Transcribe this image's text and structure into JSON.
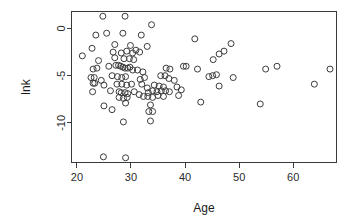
{
  "figure": {
    "background_color": "#ffffff",
    "point_color": "#3c3c3c",
    "axis_color": "#3a3a3a",
    "width": 354,
    "height": 222
  },
  "chart_data": {
    "type": "scatter",
    "title": "",
    "subtitle": "",
    "xlabel": "Age",
    "ylabel": "lnk",
    "xlim": [
      19.0,
      68.0
    ],
    "ylim": [
      -14.2,
      1.8
    ],
    "xticks": [
      20,
      30,
      40,
      50,
      60
    ],
    "xtick_labels": [
      "20",
      "30",
      "40",
      "50",
      "60"
    ],
    "yticks": [
      0,
      -5,
      -10
    ],
    "ytick_labels": [
      "0",
      "-5",
      "-10"
    ],
    "grid": false,
    "legend": null,
    "marker": "open-circle",
    "marker_size": 3,
    "n_points": 116,
    "annotations": [],
    "points": [
      [
        24.8,
        1.3
      ],
      [
        28.9,
        1.3
      ],
      [
        33.8,
        0.4
      ],
      [
        23.5,
        -0.7
      ],
      [
        25.5,
        -0.5
      ],
      [
        28.5,
        -0.5
      ],
      [
        31.9,
        -0.7
      ],
      [
        41.8,
        -1.1
      ],
      [
        48.5,
        -1.6
      ],
      [
        22.8,
        -2.1
      ],
      [
        27.0,
        -1.7
      ],
      [
        29.9,
        -1.8
      ],
      [
        33.0,
        -1.9
      ],
      [
        21.0,
        -2.9
      ],
      [
        26.7,
        -2.5
      ],
      [
        28.2,
        -2.6
      ],
      [
        29.2,
        -2.4
      ],
      [
        30.3,
        -2.6
      ],
      [
        30.9,
        -2.3
      ],
      [
        31.6,
        -2.5
      ],
      [
        46.3,
        -2.7
      ],
      [
        47.2,
        -2.4
      ],
      [
        24.0,
        -3.4
      ],
      [
        27.0,
        -3.1
      ],
      [
        28.7,
        -3.2
      ],
      [
        29.7,
        -3.2
      ],
      [
        30.5,
        -3.3
      ],
      [
        45.2,
        -3.3
      ],
      [
        23.0,
        -4.3
      ],
      [
        23.7,
        -4.2
      ],
      [
        25.9,
        -4.0
      ],
      [
        27.2,
        -3.9
      ],
      [
        27.7,
        -3.9
      ],
      [
        28.1,
        -4.0
      ],
      [
        28.5,
        -4.1
      ],
      [
        28.9,
        -4.2
      ],
      [
        29.4,
        -4.2
      ],
      [
        29.8,
        -4.1
      ],
      [
        30.3,
        -4.4
      ],
      [
        31.2,
        -4.4
      ],
      [
        32.2,
        -4.6
      ],
      [
        36.5,
        -4.2
      ],
      [
        37.2,
        -4.3
      ],
      [
        39.7,
        -4.0
      ],
      [
        40.2,
        -4.0
      ],
      [
        42.3,
        -4.3
      ],
      [
        54.9,
        -4.3
      ],
      [
        57.0,
        -4.0
      ],
      [
        66.8,
        -4.3
      ],
      [
        22.6,
        -5.2
      ],
      [
        23.2,
        -5.2
      ],
      [
        24.5,
        -5.5
      ],
      [
        26.5,
        -5.0
      ],
      [
        27.5,
        -5.1
      ],
      [
        28.3,
        -5.2
      ],
      [
        29.0,
        -5.1
      ],
      [
        31.7,
        -5.4
      ],
      [
        32.5,
        -5.2
      ],
      [
        35.5,
        -5.0
      ],
      [
        36.3,
        -5.0
      ],
      [
        37.0,
        -5.3
      ],
      [
        38.0,
        -5.5
      ],
      [
        44.4,
        -5.1
      ],
      [
        45.1,
        -5.0
      ],
      [
        45.8,
        -4.9
      ],
      [
        48.9,
        -5.2
      ],
      [
        23.0,
        -5.8
      ],
      [
        23.3,
        -5.8
      ],
      [
        25.0,
        -6.0
      ],
      [
        27.4,
        -5.9
      ],
      [
        28.3,
        -5.9
      ],
      [
        29.2,
        -6.0
      ],
      [
        30.1,
        -5.9
      ],
      [
        32.0,
        -5.9
      ],
      [
        33.0,
        -6.3
      ],
      [
        34.3,
        -6.0
      ],
      [
        35.2,
        -6.1
      ],
      [
        36.0,
        -6.2
      ],
      [
        38.5,
        -6.2
      ],
      [
        39.3,
        -6.5
      ],
      [
        46.3,
        -6.1
      ],
      [
        22.9,
        -6.7
      ],
      [
        26.2,
        -6.6
      ],
      [
        27.8,
        -6.7
      ],
      [
        28.2,
        -6.8
      ],
      [
        28.9,
        -6.8
      ],
      [
        29.4,
        -6.9
      ],
      [
        30.6,
        -6.7
      ],
      [
        31.5,
        -7.0
      ],
      [
        33.2,
        -6.8
      ],
      [
        34.0,
        -6.6
      ],
      [
        34.8,
        -6.7
      ],
      [
        35.6,
        -6.6
      ],
      [
        36.4,
        -6.6
      ],
      [
        37.1,
        -6.7
      ],
      [
        27.8,
        -7.3
      ],
      [
        28.6,
        -7.4
      ],
      [
        29.3,
        -7.3
      ],
      [
        32.3,
        -7.2
      ],
      [
        33.1,
        -7.2
      ],
      [
        34.0,
        -7.3
      ],
      [
        35.0,
        -7.1
      ],
      [
        36.0,
        -7.2
      ],
      [
        38.8,
        -7.1
      ],
      [
        25.0,
        -8.2
      ],
      [
        29.0,
        -7.9
      ],
      [
        33.6,
        -8.1
      ],
      [
        42.9,
        -7.8
      ],
      [
        53.9,
        -8.0
      ],
      [
        26.5,
        -8.6
      ],
      [
        33.3,
        -8.8
      ],
      [
        34.0,
        -8.8
      ],
      [
        28.6,
        -9.9
      ],
      [
        33.6,
        -9.8
      ],
      [
        63.9,
        -5.9
      ],
      [
        24.9,
        -13.6
      ],
      [
        29.0,
        -13.7
      ]
    ]
  }
}
